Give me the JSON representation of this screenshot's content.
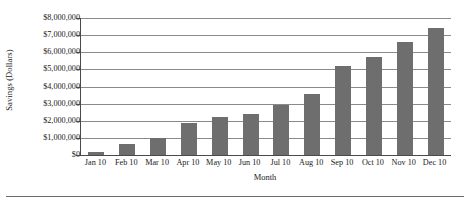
{
  "chart_data": {
    "type": "bar",
    "title": "",
    "xlabel": "Month",
    "ylabel": "Savings (Dollars)",
    "categories": [
      "Jan 10",
      "Feb 10",
      "Mar 10",
      "Apr 10",
      "May 10",
      "Jun 10",
      "Jul 10",
      "Aug 10",
      "Sep 10",
      "Oct 10",
      "Nov 10",
      "Dec 10"
    ],
    "values": [
      200000,
      650000,
      1000000,
      1850000,
      2200000,
      2400000,
      2900000,
      3550000,
      5200000,
      5700000,
      6600000,
      7400000
    ],
    "ylim": [
      0,
      8000000
    ],
    "ytick_values": [
      0,
      1000000,
      2000000,
      3000000,
      4000000,
      5000000,
      6000000,
      7000000,
      8000000
    ],
    "ytick_labels": [
      "$0",
      "$1,000,000",
      "$2,000,000",
      "$3,000,000",
      "$4,000,000",
      "$5,000,000",
      "$6,000,000",
      "$7,000,000",
      "$8,000,000"
    ],
    "grid": true,
    "legend": false,
    "bar_color": "#6e6e6e",
    "axis_color": "#4a4a4a",
    "gridline_color": "#8a8a8a"
  }
}
